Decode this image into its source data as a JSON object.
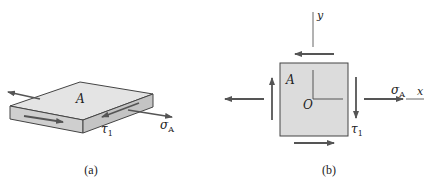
{
  "colors": {
    "stroke": "#444444",
    "arrow": "#555555",
    "top_face": "#e4e4e4",
    "front_face": "#cfcfcf",
    "side_face": "#c4c4c4",
    "square_fill": "#dcdcdc"
  },
  "panel_a": {
    "caption": "(a)",
    "surface_label": "A",
    "shear_label": "τ",
    "shear_subscript": "1",
    "stress_label": "σ",
    "stress_subscript": "A"
  },
  "panel_b": {
    "caption": "(b)",
    "element_label": "A",
    "origin_label": "O",
    "x_axis_label": "x",
    "y_axis_label": "y",
    "shear_label": "τ",
    "shear_subscript": "1",
    "stress_label": "σ",
    "stress_subscript": "A"
  }
}
